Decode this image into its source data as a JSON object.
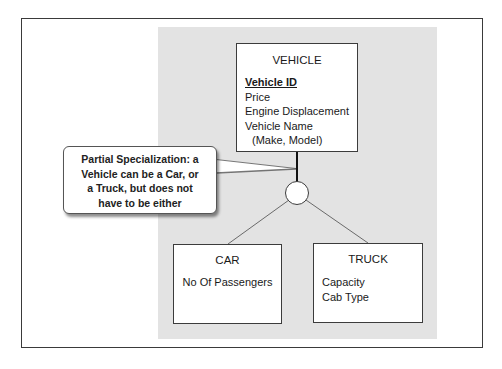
{
  "diagram": {
    "type": "EER specialization diagram",
    "supertype": {
      "name": "VEHICLE",
      "primary_key": "Vehicle ID",
      "attributes": [
        "Price",
        "Engine Displacement",
        "Vehicle Name",
        "(Make, Model)"
      ]
    },
    "subtypes": [
      {
        "name": "CAR",
        "attributes": [
          "No Of Passengers"
        ]
      },
      {
        "name": "TRUCK",
        "attributes": [
          "Capacity",
          "Cab Type"
        ]
      }
    ],
    "specialization": {
      "kind": "partial",
      "symbol": "circle"
    },
    "callout": {
      "lines": [
        "Partial Specialization: a",
        "Vehicle can be a Car, or",
        "a Truck, but does not",
        "have to be either"
      ]
    },
    "colors": {
      "panel": "#e3e3e3",
      "box_fill": "#ffffff",
      "line": "#3c3c3c",
      "frame": "#3a3a3a"
    }
  }
}
